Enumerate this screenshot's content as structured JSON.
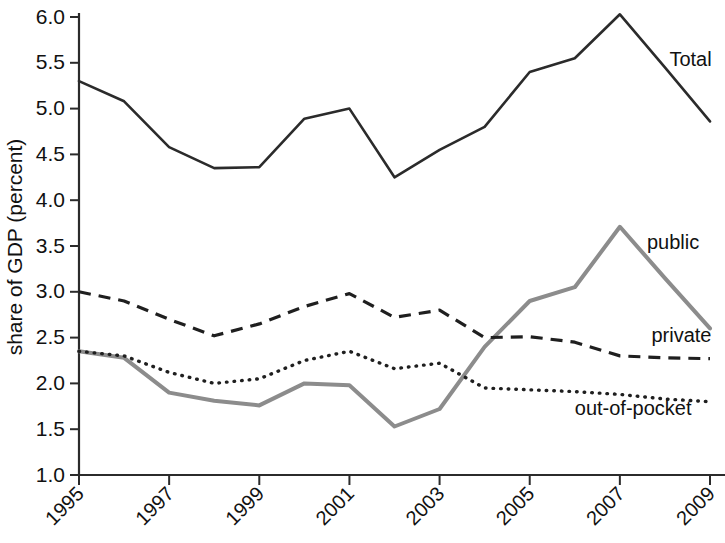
{
  "chart_data": {
    "type": "line",
    "title": "",
    "xlabel": "",
    "ylabel": "share of GDP (percent)",
    "x": [
      1995,
      1996,
      1997,
      1998,
      1999,
      2000,
      2001,
      2002,
      2003,
      2004,
      2005,
      2006,
      2007,
      2008,
      2009
    ],
    "xtick_labels": [
      "1995",
      "1997",
      "1999",
      "2001",
      "2003",
      "2005",
      "2007",
      "2009"
    ],
    "xticks": [
      1995,
      1997,
      1999,
      2001,
      2003,
      2005,
      2007,
      2009
    ],
    "ytick_labels": [
      "1.0",
      "1.5",
      "2.0",
      "2.5",
      "3.0",
      "3.5",
      "4.0",
      "4.5",
      "5.0",
      "5.5",
      "6.0"
    ],
    "yticks": [
      1.0,
      1.5,
      2.0,
      2.5,
      3.0,
      3.5,
      4.0,
      4.5,
      5.0,
      5.5,
      6.0
    ],
    "xlim": [
      1995,
      2009
    ],
    "ylim": [
      1.0,
      6.0
    ],
    "grid": false,
    "legend_position": "inline-right-of-line-ends",
    "series": [
      {
        "name": "Total",
        "style": "solid",
        "color": "#2b2b2b",
        "label": "Total",
        "values": [
          5.3,
          5.08,
          4.58,
          4.35,
          4.36,
          4.89,
          5.0,
          4.25,
          4.55,
          4.8,
          5.4,
          5.55,
          6.03,
          5.45,
          4.86
        ]
      },
      {
        "name": "public",
        "style": "solid-gray",
        "color": "#8c8c8c",
        "label": "public",
        "values": [
          2.35,
          2.28,
          1.9,
          1.81,
          1.76,
          2.0,
          1.98,
          1.53,
          1.72,
          2.4,
          2.9,
          3.05,
          3.71,
          3.15,
          2.6
        ]
      },
      {
        "name": "private",
        "style": "dashed",
        "color": "#1f1f1f",
        "label": "private",
        "values": [
          3.0,
          2.9,
          2.7,
          2.52,
          2.65,
          2.84,
          2.98,
          2.72,
          2.8,
          2.5,
          2.51,
          2.45,
          2.3,
          2.28,
          2.27
        ]
      },
      {
        "name": "out-of-pocket",
        "style": "dotted",
        "color": "#1f1f1f",
        "label": "out-of-pocket",
        "values": [
          2.35,
          2.3,
          2.12,
          2.0,
          2.05,
          2.25,
          2.35,
          2.16,
          2.22,
          1.95,
          1.93,
          1.91,
          1.88,
          1.83,
          1.8
        ]
      }
    ],
    "annotations": [
      {
        "text": "Total",
        "x": 2008.1,
        "y": 5.46
      },
      {
        "text": "public",
        "x": 2007.6,
        "y": 3.47
      },
      {
        "text": "private",
        "x": 2007.7,
        "y": 2.45
      },
      {
        "text": "out-of-pocket",
        "x": 2006.0,
        "y": 1.66
      }
    ]
  }
}
